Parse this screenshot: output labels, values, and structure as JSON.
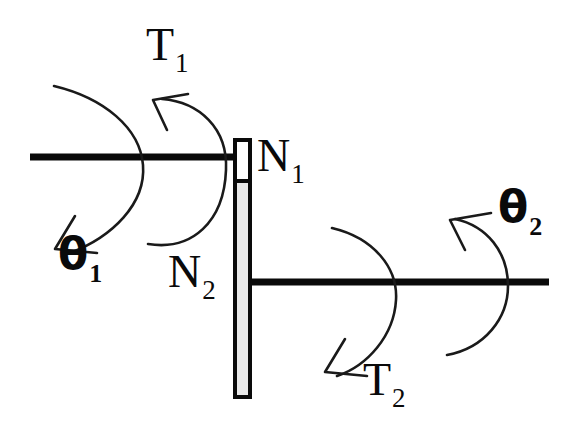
{
  "figure": {
    "kind": "mechanical-shaft-gear-diagram",
    "background_color": "#ffffff",
    "ink_color": "#0a0a0a",
    "plate_fill_upper": "#ffffff",
    "plate_fill_lower": "#e8e8e8"
  },
  "labels": {
    "torque_input": {
      "base": "T",
      "sub": "1"
    },
    "torque_output": {
      "base": "T",
      "sub": "2"
    },
    "angle_input": {
      "base": "θ",
      "sub": "1"
    },
    "angle_output": {
      "base": "θ",
      "sub": "2"
    },
    "teeth_upper": {
      "base": "N",
      "sub": "1"
    },
    "teeth_lower": {
      "base": "N",
      "sub": "2"
    }
  },
  "geometry": {
    "upper_shaft": {
      "x1": 30,
      "y1": 157,
      "x2": 234,
      "y2": 157,
      "stroke_width": 7
    },
    "lower_shaft": {
      "x1": 248,
      "y1": 282,
      "x2": 549,
      "y2": 282,
      "stroke_width": 7
    },
    "plate": {
      "x": 233,
      "y": 138,
      "width": 19,
      "height": 261,
      "stroke_width": 4
    },
    "plate_divider_y": 181,
    "arcs": [
      {
        "name": "theta1-arc",
        "cx": 120,
        "cy": 162,
        "r": 100,
        "arrow": "down-left"
      },
      {
        "name": "T1-arc",
        "cx": 298,
        "cy": 162,
        "r": 118,
        "arrow": "up-left"
      },
      {
        "name": "T2-arc",
        "cx": 330,
        "cy": 285,
        "r": 95,
        "arrow": "down-left"
      },
      {
        "name": "theta2-arc",
        "cx": 443,
        "cy": 285,
        "r": 98,
        "arrow": "up-left"
      }
    ]
  }
}
